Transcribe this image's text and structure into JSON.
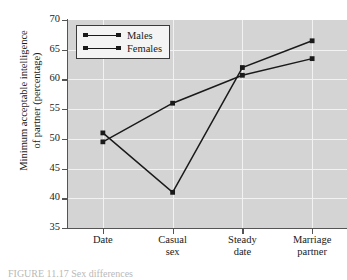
{
  "chart_data": {
    "type": "line",
    "title": "",
    "xlabel": "",
    "ylabel": "Minimum acceptable intelligence of partner (percentage)",
    "ylabel_line1": "Minimum acceptable intelligence",
    "ylabel_line2": "of partner (percentage)",
    "categories": [
      "Date",
      "Casual sex",
      "Steady date",
      "Marriage partner"
    ],
    "category_lines": [
      [
        "Date",
        ""
      ],
      [
        "Casual",
        "sex"
      ],
      [
        "Steady",
        "date"
      ],
      [
        "Marriage",
        "partner"
      ]
    ],
    "ylim": [
      35,
      70
    ],
    "yticks": [
      35,
      40,
      45,
      50,
      55,
      60,
      65,
      70
    ],
    "ytick_labels": [
      "35",
      "40",
      "45",
      "50",
      "55",
      "60",
      "65",
      "70"
    ],
    "grid": true,
    "legend_position": "upper-left",
    "series": [
      {
        "name": "Males",
        "values": [
          51.0,
          41.0,
          62.0,
          66.5
        ],
        "color": "#1a1a1a"
      },
      {
        "name": "Females",
        "values": [
          49.5,
          56.0,
          60.7,
          63.5
        ],
        "color": "#1a1a1a"
      }
    ],
    "colors": {
      "plot_background": "#d4d4d4",
      "gridline": "#f2f2f2",
      "axis": "#555555",
      "line": "#1a1a1a",
      "legend_background": "#f4f4f4"
    }
  },
  "legend": {
    "items": [
      {
        "label": "Males"
      },
      {
        "label": "Females"
      }
    ]
  },
  "caption": {
    "text": "FIGURE 11.17   Sex differences"
  }
}
